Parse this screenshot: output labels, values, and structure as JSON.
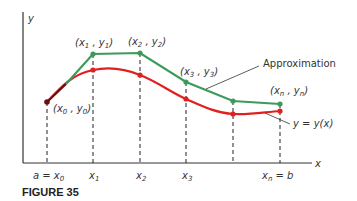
{
  "figure": {
    "caption": "FIGURE 35",
    "axis_labels": {
      "x": "x",
      "y": "y"
    },
    "x_ticks": [
      {
        "px": 47,
        "label": "a = x",
        "sub": "0"
      },
      {
        "px": 93,
        "label": "x",
        "sub": "1"
      },
      {
        "px": 140,
        "label": "x",
        "sub": "2"
      },
      {
        "px": 186,
        "label": "x",
        "sub": "3"
      },
      {
        "px": 233,
        "label": "",
        "sub": ""
      },
      {
        "px": 280,
        "label": "x",
        "sub": "n",
        "suffix": " = b"
      }
    ],
    "point_labels": [
      {
        "text": "(x",
        "sub1": "0",
        "mid": ", y",
        "sub2": "0",
        "end": ")",
        "x": 54,
        "y": 112
      },
      {
        "text": "(x",
        "sub1": "1",
        "mid": ", y",
        "sub2": "1",
        "end": ")",
        "x": 75,
        "y": 45
      },
      {
        "text": "(x",
        "sub1": "2",
        "mid": ", y",
        "sub2": "2",
        "end": ")",
        "x": 128,
        "y": 44
      },
      {
        "text": "(x",
        "sub1": "3",
        "mid": ", y",
        "sub2": "3",
        "end": ")",
        "x": 180,
        "y": 74
      },
      {
        "text": "(x",
        "sub1": "n",
        "mid": ", y",
        "sub2": "n",
        "end": ")",
        "x": 270,
        "y": 93
      }
    ],
    "annotations": {
      "approximation": "Approximation",
      "curve": "y = y(x)"
    },
    "colors": {
      "approximation": "#3d9a5c",
      "curve": "#e02020",
      "start_point": "#6b1010",
      "axis": "#333333",
      "dashes": "#222222"
    },
    "approximation_points": [
      [
        47,
        102
      ],
      [
        93,
        54
      ],
      [
        140,
        53
      ],
      [
        186,
        82
      ],
      [
        233,
        101
      ],
      [
        280,
        104
      ]
    ],
    "curve_points": [
      [
        47,
        102
      ],
      [
        93,
        70
      ],
      [
        140,
        75
      ],
      [
        186,
        99
      ],
      [
        233,
        114
      ],
      [
        280,
        111
      ]
    ]
  }
}
